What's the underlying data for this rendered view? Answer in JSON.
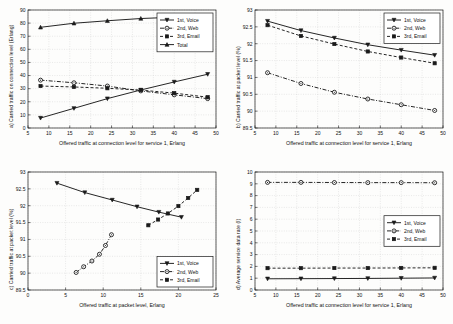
{
  "figure": {
    "background": "#fdfdfc",
    "line_color": "#1a1a1a",
    "grid_color": "#c9c9c9"
  },
  "chart_data": [
    {
      "id": "a",
      "type": "line",
      "title": "",
      "xlabel": "Offered traffic at connection level for service 1, Erlang",
      "ylabel": "a) Carried traffic on connection level (Erlang)",
      "xlim": [
        5,
        50
      ],
      "ylim": [
        0,
        90
      ],
      "xticks": [
        5,
        10,
        15,
        20,
        25,
        30,
        35,
        40,
        45,
        50
      ],
      "yticks": [
        0,
        10,
        20,
        30,
        40,
        50,
        60,
        70,
        80,
        90
      ],
      "grid": true,
      "legend_position": "upper right",
      "x": [
        8,
        16,
        24,
        32,
        40,
        48
      ],
      "series": [
        {
          "name": "1st, Voice",
          "marker": "triangle-down",
          "style": "solid",
          "values": [
            7.6,
            15.0,
            22.4,
            29.0,
            35.1,
            41.0
          ]
        },
        {
          "name": "2nd, Web",
          "marker": "circle",
          "style": "dashdot",
          "values": [
            36.5,
            34.5,
            32.0,
            28.3,
            25.3,
            22.4
          ]
        },
        {
          "name": "3rd, Email",
          "marker": "square",
          "style": "dashed",
          "values": [
            32.0,
            31.3,
            30.3,
            28.9,
            26.6,
            23.5
          ]
        },
        {
          "name": "Total",
          "marker": "triangle-up",
          "style": "solid",
          "values": [
            76.8,
            79.9,
            81.8,
            83.5,
            84.5,
            85.2
          ]
        }
      ]
    },
    {
      "id": "b",
      "type": "line",
      "title": "",
      "xlabel": "Offered traffic at connection level for service 1, Erlang",
      "ylabel": "b) Carried traffic at packet level (%)",
      "xlim": [
        5,
        50
      ],
      "ylim": [
        89.5,
        93
      ],
      "xticks": [
        5,
        10,
        15,
        20,
        25,
        30,
        35,
        40,
        45,
        50
      ],
      "yticks": [
        89.5,
        90,
        90.5,
        91,
        91.5,
        92,
        92.5,
        93
      ],
      "ytick_labels": [
        "89.5",
        "90",
        "90.5",
        "91",
        "91.5",
        "92",
        "92.5",
        "93"
      ],
      "grid": true,
      "legend_position": "upper right",
      "x": [
        8,
        16,
        24,
        32,
        40,
        48
      ],
      "series": [
        {
          "name": "1st, Voice",
          "marker": "triangle-down",
          "style": "solid",
          "values": [
            92.67,
            92.39,
            92.17,
            91.97,
            91.81,
            91.66
          ]
        },
        {
          "name": "2nd, Web",
          "marker": "circle",
          "style": "dashdot",
          "values": [
            91.14,
            90.82,
            90.56,
            90.36,
            90.19,
            90.02
          ]
        },
        {
          "name": "3rd, Email",
          "marker": "square",
          "style": "dashed",
          "values": [
            92.55,
            92.23,
            91.99,
            91.77,
            91.59,
            91.42
          ]
        }
      ]
    },
    {
      "id": "c",
      "type": "line",
      "title": "",
      "xlabel": "Offered traffic at packet level, Erlang",
      "ylabel": "c) Carried traffic at packet level (%)",
      "xlim": [
        0,
        25
      ],
      "ylim": [
        89.5,
        93
      ],
      "xticks": [
        0,
        5,
        10,
        15,
        20,
        25
      ],
      "yticks": [
        89.5,
        90,
        90.5,
        91,
        91.5,
        92,
        92.5,
        93
      ],
      "ytick_labels": [
        "89.5",
        "90",
        "90.5",
        "91",
        "91.5",
        "92",
        "92.5",
        "93"
      ],
      "grid": true,
      "legend_position": "lower right",
      "series": [
        {
          "name": "1st, Voice",
          "marker": "triangle-down",
          "style": "solid",
          "x": [
            3.85,
            7.55,
            11.2,
            14.5,
            17.4,
            20.4
          ],
          "values": [
            92.67,
            92.39,
            92.17,
            91.97,
            91.81,
            91.66
          ]
        },
        {
          "name": "2nd, Web",
          "marker": "circle",
          "style": "dashdot",
          "x": [
            6.4,
            7.4,
            8.5,
            9.5,
            10.3,
            11.1
          ],
          "values": [
            90.02,
            90.19,
            90.36,
            90.56,
            90.82,
            91.14
          ]
        },
        {
          "name": "3rd, Email",
          "marker": "square",
          "style": "dashed",
          "x": [
            16.0,
            17.3,
            18.6,
            20.0,
            21.3,
            22.5
          ],
          "values": [
            91.42,
            91.59,
            91.77,
            91.99,
            92.23,
            92.47
          ]
        }
      ]
    },
    {
      "id": "d",
      "type": "line",
      "title": "",
      "xlabel": "Offered traffic at connection level for service 1, Erlang",
      "ylabel": "d) Average service data rate (l)",
      "xlim": [
        5,
        50
      ],
      "ylim": [
        0,
        10
      ],
      "xticks": [
        5,
        10,
        15,
        20,
        25,
        30,
        35,
        40,
        45,
        50
      ],
      "yticks": [
        0,
        1,
        2,
        3,
        4,
        5,
        6,
        7,
        8,
        9,
        10
      ],
      "grid": true,
      "legend_position": "center right",
      "x": [
        8,
        16,
        24,
        32,
        40,
        48
      ],
      "series": [
        {
          "name": "1st, Voice",
          "marker": "triangle-down",
          "style": "solid",
          "values": [
            0.95,
            0.96,
            0.97,
            0.98,
            1.0,
            1.02
          ]
        },
        {
          "name": "2nd, Web",
          "marker": "circle",
          "style": "dashdot",
          "values": [
            9.12,
            9.12,
            9.11,
            9.1,
            9.1,
            9.09
          ]
        },
        {
          "name": "3rd, Email",
          "marker": "square",
          "style": "dashed",
          "values": [
            1.85,
            1.85,
            1.86,
            1.86,
            1.87,
            1.88
          ]
        }
      ]
    }
  ]
}
